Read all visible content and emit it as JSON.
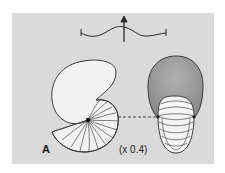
{
  "figure": {
    "panel_label": "A",
    "scale_label": "(x 0.4)",
    "icons": {
      "orientation_symbol": "wavy-line-with-up-arrow",
      "side_view": "nautiloid-shell-lateral-view",
      "front_view": "nautiloid-shell-apertural-view",
      "connector": "dashed-line"
    },
    "colors": {
      "panel_background": "#dadada",
      "shell_outline": "#3a3a3a",
      "shell_fill": "#f2f2f2",
      "front_body_fill": "#9a9a9a",
      "suture_lines": "#4a4a4a"
    }
  }
}
